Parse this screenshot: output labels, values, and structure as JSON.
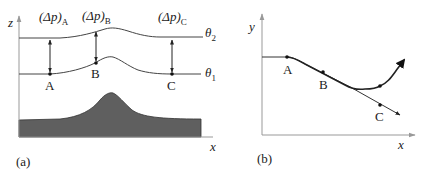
{
  "panel_a": {
    "caption": "(a)",
    "axis_z": "z",
    "axis_x": "x",
    "isentropes": [
      {
        "symbol": "θ",
        "sub": "2"
      },
      {
        "symbol": "θ",
        "sub": "1"
      }
    ],
    "pressure_labels": [
      {
        "prefix": "(Δp)",
        "sub": "A"
      },
      {
        "prefix": "(Δp)",
        "sub": "B"
      },
      {
        "prefix": "(Δp)",
        "sub": "C"
      }
    ],
    "points": [
      "A",
      "B",
      "C"
    ],
    "terrain_color": "#5a5a5a"
  },
  "panel_b": {
    "caption": "(b)",
    "axis_y": "y",
    "axis_x": "x",
    "points": [
      "A",
      "B",
      "C"
    ]
  }
}
